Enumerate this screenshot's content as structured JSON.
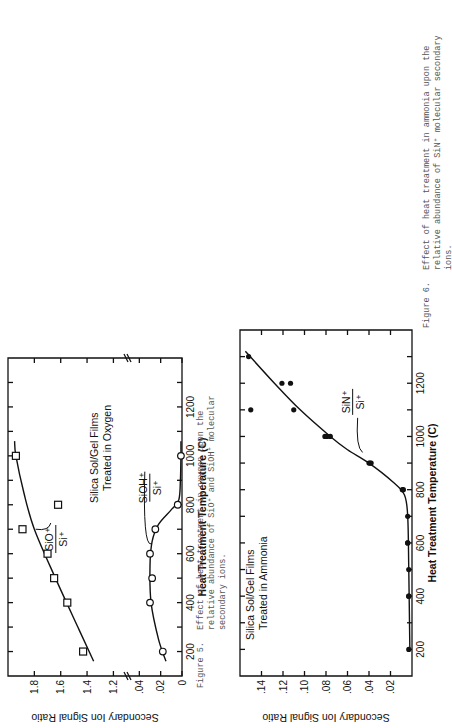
{
  "figures": [
    {
      "id": "figure-5",
      "caption_label": "Figure 5.",
      "caption_lines": [
        "Effect of heat treatment in oxygen upon the",
        "relative abundance of SiO⁺ and SiOH⁺ molecular",
        "secondary ions."
      ],
      "title_lines": [
        "Silica Sol/Gel Films",
        "Treated in Oxygen"
      ]
    },
    {
      "id": "figure-6",
      "caption_label": "Figure 6.",
      "caption_lines": [
        "Effect of heat treatment in ammonia upon the",
        "relative abundance of SiN⁺ molecular secondary",
        "ions."
      ],
      "title_lines": [
        "Silica Sol/Gel Films",
        "Treated in Ammonia"
      ]
    }
  ],
  "chart_data": [
    {
      "type": "scatter",
      "title": "Silica Sol/Gel Films Treated in Oxygen",
      "xlabel": "Heat Treatment Temperature (C)",
      "ylabel": "Secondary Ion Signal Ratio",
      "xlim": [
        100,
        1400
      ],
      "x_ticks": [
        200,
        400,
        600,
        800,
        1000,
        1200
      ],
      "y_axis_broken": true,
      "y_ticks_lower": [
        "0",
        ".02",
        ".04"
      ],
      "y_ticks_upper": [
        "1.2",
        "1.4",
        "1.6",
        "1.8"
      ],
      "ylim_lower": [
        0,
        0.045
      ],
      "ylim_upper": [
        1.15,
        2.0
      ],
      "grid": false,
      "series": [
        {
          "name": "SiO+/Si+",
          "marker": "open-square",
          "axis": "upper",
          "x": [
            200,
            400,
            500,
            600,
            700,
            800,
            1000
          ],
          "y": [
            1.43,
            1.55,
            1.65,
            1.7,
            1.89,
            1.62,
            1.94
          ],
          "fit_x": [
            160,
            300,
            500,
            700,
            850,
            1000,
            1060
          ],
          "fit_y": [
            1.35,
            1.47,
            1.64,
            1.8,
            1.88,
            1.94,
            1.95
          ]
        },
        {
          "name": "SiOH+/Si+",
          "marker": "open-circle",
          "axis": "lower",
          "x": [
            200,
            400,
            500,
            600,
            700,
            800,
            1000
          ],
          "y": [
            0.018,
            0.03,
            0.028,
            0.03,
            0.025,
            0.004,
            0.001
          ],
          "fit_x": [
            160,
            250,
            400,
            550,
            650,
            720,
            780,
            820,
            900,
            1000,
            1060
          ],
          "fit_y": [
            0.015,
            0.022,
            0.029,
            0.03,
            0.028,
            0.022,
            0.01,
            0.003,
            0.0015,
            0.001,
            0.001
          ]
        }
      ],
      "annotations": [
        "SiO⁺/Si⁺",
        "SiOH⁺/Si⁺"
      ]
    },
    {
      "type": "scatter",
      "title": "Silica Sol/Gel Films Treated in Ammonia",
      "xlabel": "Heat Treatment Temperature (C)",
      "ylabel": "Secondary Ion Signal Ratio",
      "xlim": [
        100,
        1400
      ],
      "x_ticks": [
        200,
        400,
        600,
        800,
        1000,
        1200
      ],
      "y_ticks": [
        ".02",
        ".04",
        ".06",
        ".08",
        ".10",
        ".12",
        ".14"
      ],
      "ylim": [
        0,
        0.16
      ],
      "grid": false,
      "series": [
        {
          "name": "SiN+/Si+",
          "marker": "filled-circle",
          "x": [
            200,
            400,
            400,
            500,
            600,
            600,
            700,
            800,
            800,
            900,
            900,
            900,
            1000,
            1000,
            1000,
            1100,
            1100,
            1200,
            1200,
            1300
          ],
          "y": [
            0.003,
            0.003,
            0.003,
            0.003,
            0.004,
            0.004,
            0.004,
            0.009,
            0.008,
            0.04,
            0.039,
            0.038,
            0.081,
            0.079,
            0.076,
            0.11,
            0.15,
            0.121,
            0.113,
            0.152
          ],
          "fit_x": [
            200,
            500,
            700,
            780,
            830,
            900,
            950,
            1000,
            1100,
            1200,
            1320
          ],
          "fit_y": [
            0.002,
            0.003,
            0.004,
            0.007,
            0.018,
            0.04,
            0.06,
            0.076,
            0.104,
            0.128,
            0.155
          ]
        }
      ],
      "annotations": [
        "SiN⁺/Si⁺"
      ]
    }
  ]
}
